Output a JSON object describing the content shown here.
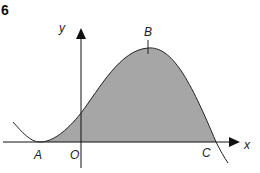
{
  "question_number": "6",
  "axes": {
    "x_label": "x",
    "y_label": "y",
    "origin_label": "O"
  },
  "points": {
    "A": "A",
    "B": "B",
    "C": "C"
  },
  "colors": {
    "shaded_region": "#a6a6a6",
    "curve": "#222222",
    "axes": "#111111"
  }
}
